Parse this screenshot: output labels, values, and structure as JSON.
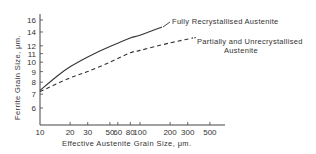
{
  "chart_data": {
    "type": "line",
    "title": "",
    "xlabel": "Effective Austenite Grain Size, μm.",
    "ylabel": "Ferrite Grain Size, μm.",
    "xscale": "log",
    "yscale": "log",
    "xlim": [
      10,
      600
    ],
    "ylim": [
      5.3,
      17
    ],
    "x_ticks": [
      10,
      20,
      30,
      50,
      60,
      80,
      100,
      200,
      300,
      500
    ],
    "x_tick_labels": [
      "10",
      "20",
      "30",
      "50",
      "60",
      "80",
      "100",
      "200",
      "300",
      "500"
    ],
    "y_ticks": [
      6,
      7,
      8,
      9,
      10,
      11,
      12,
      14,
      16
    ],
    "y_tick_labels": [
      "6",
      "7",
      "8",
      "9",
      "10",
      "11",
      "12",
      "14",
      "16"
    ],
    "grid": false,
    "legend": "inline labels at line ends",
    "series": [
      {
        "name": "Fully Recrystallised Austenite",
        "style": "solid",
        "x": [
          10,
          15,
          20,
          30,
          50,
          80,
          100,
          166
        ],
        "y": [
          7.3,
          8.6,
          9.5,
          10.6,
          11.9,
          13.1,
          13.5,
          14.8
        ]
      },
      {
        "name": "Partially and Unrecrystallised Austenite",
        "style": "dashed",
        "x": [
          10,
          20,
          30,
          50,
          80,
          100,
          200,
          340
        ],
        "y": [
          7.2,
          8.4,
          9.0,
          10.0,
          11.1,
          11.4,
          12.4,
          13.1
        ]
      }
    ],
    "annotations": [
      {
        "text": "Fully Recrystallised Austenite",
        "lines": [
          "Fully Recrystallised Austenite"
        ]
      },
      {
        "text": "Partially and Unrecrystallised Austenite",
        "lines": [
          "Partially and Unrecrystallised",
          "Austenite"
        ]
      }
    ]
  },
  "labels": {
    "xlabel": "Effective Austenite Grain Size, μm.",
    "ylabel": "Ferrite Grain Size, μm.",
    "series0": "Fully Recrystallised Austenite",
    "series1_line1": "Partially and Unrecrystallised",
    "series1_line2": "Austenite"
  }
}
